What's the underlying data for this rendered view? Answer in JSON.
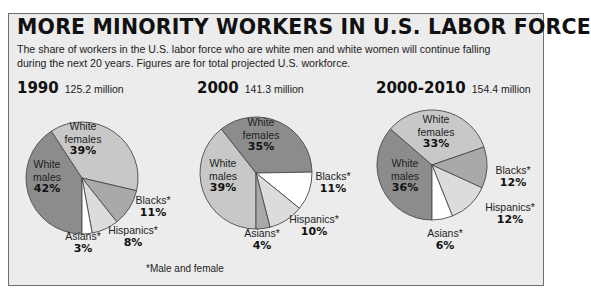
{
  "header": {
    "title": "MORE MINORITY WORKERS IN U.S. LABOR FORCE",
    "subtitle": "The share of workers in the U.S. labor force who are white men and white women will continue falling during the next 20 years. Figures are for total projected U.S. workforce."
  },
  "footnote": "*Male and female",
  "colors": {
    "background": "#ececec",
    "dark_grey": "#8c8c8c",
    "mid_grey": "#a9a9a9",
    "light_grey": "#c8c8c8",
    "pale_grey": "#dcdcdc",
    "white": "#ffffff",
    "outline": "#4a4a4a"
  },
  "charts": [
    {
      "year": "1990",
      "total": "125.2 million",
      "labels": {
        "white_males": {
          "name": "White\nmales",
          "pct": "42%"
        },
        "white_females": {
          "name": "White\nfemales",
          "pct": "39%"
        },
        "blacks": {
          "name": "Blacks*",
          "pct": "11%"
        },
        "hispanics": {
          "name": "Hispanics*",
          "pct": "8%"
        },
        "asians": {
          "name": "Asians*",
          "pct": "3%"
        }
      }
    },
    {
      "year": "2000",
      "total": "141.3 million",
      "labels": {
        "white_males": {
          "name": "White\nmales",
          "pct": "39%"
        },
        "white_females": {
          "name": "White\nfemales",
          "pct": "35%"
        },
        "blacks": {
          "name": "Blacks*",
          "pct": "11%"
        },
        "hispanics": {
          "name": "Hispanics*",
          "pct": "10%"
        },
        "asians": {
          "name": "Asians*",
          "pct": "4%"
        }
      }
    },
    {
      "year": "2000-2010",
      "total": "154.4 million",
      "labels": {
        "white_males": {
          "name": "White\nmales",
          "pct": "36%"
        },
        "white_females": {
          "name": "White\nfemales",
          "pct": "33%"
        },
        "blacks": {
          "name": "Blacks*",
          "pct": "12%"
        },
        "hispanics": {
          "name": "Hispanics*",
          "pct": "12%"
        },
        "asians": {
          "name": "Asians*",
          "pct": "6%"
        }
      }
    }
  ],
  "chart_data": [
    {
      "type": "pie",
      "title": "1990",
      "subtitle": "125.2 million",
      "categories": [
        "White males",
        "White females",
        "Blacks*",
        "Hispanics*",
        "Asians*"
      ],
      "values": [
        42,
        39,
        11,
        8,
        3
      ],
      "colors": [
        "#8c8c8c",
        "#c8c8c8",
        "#a9a9a9",
        "#dcdcdc",
        "#ffffff"
      ]
    },
    {
      "type": "pie",
      "title": "2000",
      "subtitle": "141.3 million",
      "categories": [
        "White males",
        "White females",
        "Blacks*",
        "Hispanics*",
        "Asians*"
      ],
      "values": [
        39,
        35,
        11,
        10,
        4
      ],
      "colors": [
        "#c8c8c8",
        "#8c8c8c",
        "#ffffff",
        "#dcdcdc",
        "#a9a9a9"
      ]
    },
    {
      "type": "pie",
      "title": "2000-2010",
      "subtitle": "154.4 million",
      "categories": [
        "White males",
        "White females",
        "Blacks*",
        "Hispanics*",
        "Asians*"
      ],
      "values": [
        36,
        33,
        12,
        12,
        6
      ],
      "colors": [
        "#8c8c8c",
        "#c8c8c8",
        "#a9a9a9",
        "#dcdcdc",
        "#ffffff"
      ]
    }
  ]
}
